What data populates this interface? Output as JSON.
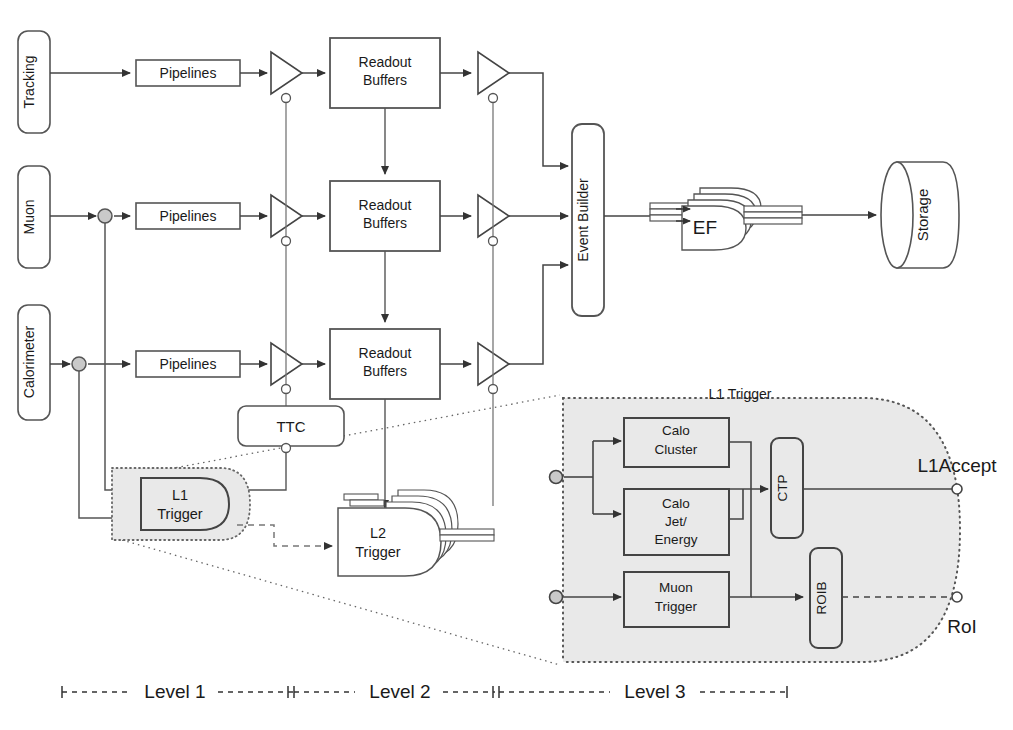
{
  "figure": {
    "caption_fragment": "Figure: Schematic overview of the three-level trigger and data acquisition chain"
  },
  "colors": {
    "line": "#4a4a4a",
    "line_dark": "#222222",
    "text": "#1a1a1a",
    "shade_fill": "#e9e9e9",
    "shade_stroke": "#555555",
    "dot_fill": "#c9c9c9",
    "white": "#ffffff"
  },
  "detectors": [
    {
      "id": "tracking",
      "label": "Tracking"
    },
    {
      "id": "muon",
      "label": "Muon"
    },
    {
      "id": "calorimeter",
      "label": "Calorimeter"
    }
  ],
  "chain": {
    "pipeline_label": "Pipelines",
    "readout_label_line1": "Readout",
    "readout_label_line2": "Buffers",
    "rows": [
      {
        "id": "row-tracking",
        "pipelines": "Pipelines",
        "readout": "Readout Buffers"
      },
      {
        "id": "row-muon",
        "pipelines": "Pipelines",
        "readout": "Readout Buffers"
      },
      {
        "id": "row-calorimeter",
        "pipelines": "Pipelines",
        "readout": "Readout Buffers"
      }
    ]
  },
  "nodes": {
    "ttc": "TTC",
    "l1_trigger_line1": "L1",
    "l1_trigger_line2": "Trigger",
    "l2_trigger_line1": "L2",
    "l2_trigger_line2": "Trigger",
    "event_builder": "Event Builder",
    "ef": "EF",
    "storage": "Storage"
  },
  "detail_panel": {
    "title": "L1 Trigger",
    "blocks": [
      {
        "id": "calo-cluster",
        "line1": "Calo",
        "line2": "Cluster",
        "line3": ""
      },
      {
        "id": "calo-jet",
        "line1": "Calo",
        "line2": "Jet/",
        "line3": "Energy"
      },
      {
        "id": "muon-trigger",
        "line1": "Muon",
        "line2": "Trigger",
        "line3": ""
      }
    ],
    "ctp": "CTP",
    "roib": "ROIB",
    "outputs": [
      {
        "id": "l1accept",
        "label": "L1Accept"
      },
      {
        "id": "roi",
        "label": "RoI"
      }
    ]
  },
  "levels": [
    {
      "id": "level-1",
      "label": "Level 1"
    },
    {
      "id": "level-2",
      "label": "Level 2"
    },
    {
      "id": "level-3",
      "label": "Level 3"
    }
  ]
}
